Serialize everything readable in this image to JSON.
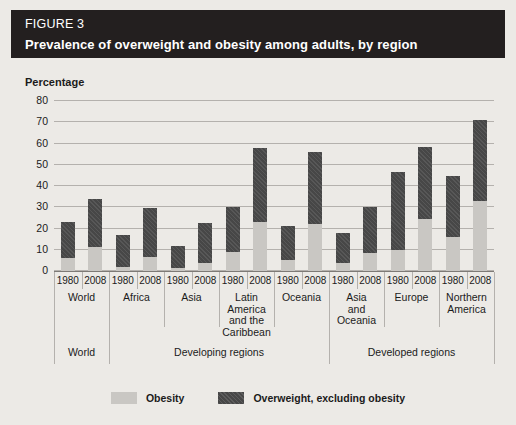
{
  "figure": {
    "number": "FIGURE 3",
    "title": "Prevalence of overweight and obesity among adults, by region"
  },
  "colors": {
    "title_bar_bg": "#231f1f",
    "title_text": "#ffffff",
    "panel_bg": "#eceae6",
    "obesity": "#c9c7c3",
    "overweight": "#474747",
    "gridline": "#b4b1ad",
    "axis": "#7d7a76",
    "text": "#1b1b1b"
  },
  "legend": {
    "position": "bottom-center",
    "items": [
      {
        "label": "Obesity",
        "swatch": "obesity-swatch"
      },
      {
        "label": "Overweight, excluding obesity",
        "swatch": "overweight-swatch"
      }
    ]
  },
  "chart_data": {
    "type": "bar",
    "title": "Prevalence of overweight and obesity among adults, by region",
    "subtitle": "FIGURE 3",
    "xlabel": "",
    "ylabel": "Percentage",
    "ylim": [
      0,
      80
    ],
    "yticks": [
      0,
      10,
      20,
      30,
      40,
      50,
      60,
      70,
      80
    ],
    "grid": true,
    "stacked": true,
    "categories": [
      "World 1980",
      "World 2008",
      "Africa 1980",
      "Africa 2008",
      "Asia 1980",
      "Asia 2008",
      "Latin America and the Caribbean 1980",
      "Latin America and the Caribbean 2008",
      "Oceania 1980",
      "Oceania 2008",
      "Asia and Oceania 1980",
      "Asia and Oceania 2008",
      "Europe 1980",
      "Europe 2008",
      "Northern America 1980",
      "Northern America 2008"
    ],
    "series": [
      {
        "name": "Obesity",
        "values": [
          6,
          11.5,
          2,
          6.5,
          1.5,
          4,
          9,
          23,
          5,
          22,
          4,
          8.5,
          10,
          24.5,
          16,
          33
        ]
      },
      {
        "name": "Overweight, excluding obesity",
        "values": [
          17,
          22.5,
          15,
          23,
          10.5,
          18.5,
          21,
          35,
          16,
          34,
          14,
          21.5,
          36.5,
          34,
          28.5,
          38
        ]
      }
    ],
    "totals": [
      23,
      34,
      17,
      29.5,
      12,
      22.5,
      30,
      58,
      21,
      56,
      18,
      30,
      46.5,
      58.5,
      44.5,
      71
    ],
    "groups": [
      {
        "label": "World",
        "years": [
          "1980",
          "2008"
        ],
        "super": "World"
      },
      {
        "label": "Africa",
        "years": [
          "1980",
          "2008"
        ],
        "super": "Developing regions"
      },
      {
        "label": "Asia",
        "years": [
          "1980",
          "2008"
        ],
        "super": "Developing regions"
      },
      {
        "label": "Latin\nAmerica\nand the\nCaribbean",
        "years": [
          "1980",
          "2008"
        ],
        "super": "Developing regions"
      },
      {
        "label": "Oceania",
        "years": [
          "1980",
          "2008"
        ],
        "super": "Developing regions"
      },
      {
        "label": "Asia\nand\nOceania",
        "years": [
          "1980",
          "2008"
        ],
        "super": "Developed regions"
      },
      {
        "label": "Europe",
        "years": [
          "1980",
          "2008"
        ],
        "super": "Developed regions"
      },
      {
        "label": "Northern\nAmerica",
        "years": [
          "1980",
          "2008"
        ],
        "super": "Developed regions"
      }
    ],
    "super_groups": [
      {
        "label": "World",
        "start_group": 0,
        "end_group": 0
      },
      {
        "label": "Developing regions",
        "start_group": 1,
        "end_group": 4
      },
      {
        "label": "Developed regions",
        "start_group": 5,
        "end_group": 7
      }
    ]
  }
}
